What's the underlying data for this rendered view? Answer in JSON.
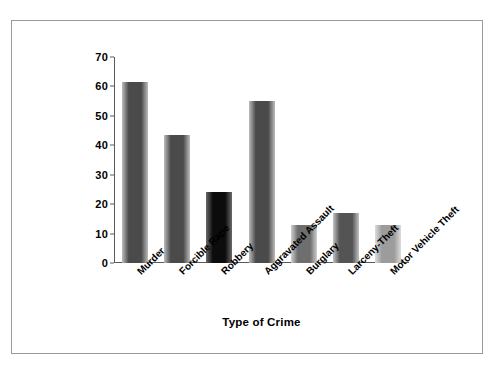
{
  "chart_data": {
    "type": "bar",
    "title": "",
    "xlabel": "Type of Crime",
    "ylabel": "Percentage Cleared",
    "categories": [
      "Murder",
      "Forcible Rape",
      "Robbery",
      "Aggravated Assault",
      "Burglary",
      "Larceny-Theft",
      "Motor Vehicle Theft"
    ],
    "values": [
      61.5,
      43.5,
      24,
      55,
      13,
      17,
      13
    ],
    "ylim": [
      0,
      70
    ],
    "yticks": [
      0,
      10,
      20,
      30,
      40,
      50,
      60,
      70
    ],
    "ytick_labels": [
      "0",
      "10",
      "20",
      "30",
      "40",
      "50",
      "60",
      "70"
    ],
    "grid": false,
    "legend": false,
    "bar_colors": [
      "#4a4a4a",
      "#4a4a4a",
      "#0c0c0c",
      "#4a4a4a",
      "#6e6e6e",
      "#545454",
      "#9c9c9c"
    ],
    "bar_highlight_colors": [
      "#bcbcbc",
      "#bcbcbc",
      "#6a6a6a",
      "#bcbcbc",
      "#cfcfcf",
      "#c2c2c2",
      "#dcdcdc"
    ],
    "axis_color": "#5a5a5a",
    "frame_color": "#9a9a9a",
    "background": "#ffffff",
    "label_rotation": -45
  }
}
